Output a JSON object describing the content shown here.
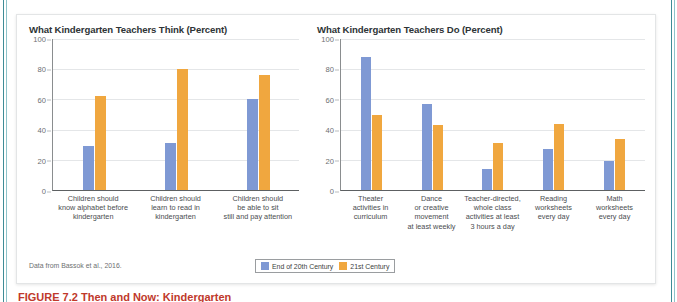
{
  "figure": {
    "source_note": "Data from Bassok et al., 2016.",
    "caption": "FIGURE 7.2  Then and Now: Kindergarten",
    "legend": [
      {
        "label": "End of 20th Century",
        "color": "#7f99d4"
      },
      {
        "label": "21st Century",
        "color": "#f0a73f"
      }
    ]
  },
  "chart_data": [
    {
      "type": "bar",
      "title": "What Kindergarten Teachers Think (Percent)",
      "xlabel": "",
      "ylabel": "",
      "ylim": [
        0,
        100
      ],
      "yticks": [
        100,
        80,
        60,
        40,
        20,
        0
      ],
      "grid": true,
      "legend_position": "bottom",
      "categories": [
        "Children should know alphabet before kindergarten",
        "Children should learn to read in kindergarten",
        "Children should be able to sit still and pay attention"
      ],
      "category_lines": [
        [
          "Children should",
          "know alphabet before",
          "kindergarten"
        ],
        [
          "Children should",
          "learn to read in",
          "kindergarten"
        ],
        [
          "Children should",
          "be able to sit",
          "still and pay attention"
        ]
      ],
      "series": [
        {
          "name": "End of 20th Century",
          "color": "#7f99d4",
          "values": [
            29,
            31,
            60
          ]
        },
        {
          "name": "21st Century",
          "color": "#f0a73f",
          "values": [
            62,
            80,
            76
          ]
        }
      ]
    },
    {
      "type": "bar",
      "title": "What Kindergarten Teachers Do (Percent)",
      "xlabel": "",
      "ylabel": "",
      "ylim": [
        0,
        100
      ],
      "yticks": [
        100,
        80,
        60,
        40,
        20,
        0
      ],
      "grid": true,
      "legend_position": "bottom",
      "categories": [
        "Theater activities in curriculum",
        "Dance or creative movement at least weekly",
        "Teacher-directed, whole class activities at least 3 hours a day",
        "Reading worksheets every day",
        "Math worksheets every day"
      ],
      "category_lines": [
        [
          "Theater",
          "activities in",
          "curriculum"
        ],
        [
          "Dance",
          "or creative",
          "movement",
          "at least weekly"
        ],
        [
          "Teacher-directed,",
          "whole class",
          "activities at least",
          "3 hours a day"
        ],
        [
          "Reading",
          "worksheets",
          "every day"
        ],
        [
          "Math",
          "worksheets",
          "every day"
        ]
      ],
      "series": [
        {
          "name": "End of 20th Century",
          "color": "#7f99d4",
          "values": [
            88,
            57,
            14,
            27,
            19
          ]
        },
        {
          "name": "21st Century",
          "color": "#f0a73f",
          "values": [
            50,
            43,
            31,
            44,
            34
          ]
        }
      ]
    }
  ]
}
